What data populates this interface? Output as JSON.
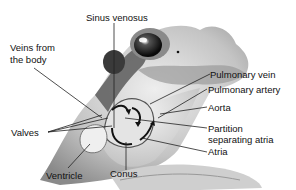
{
  "diagram": {
    "labels": {
      "sinus_venosus": "Sinus venosus",
      "veins_from_body_line1": "Veins from",
      "veins_from_body_line2": "the body",
      "pulmonary_vein": "Pulmonary vein",
      "pulmonary_artery": "Pulmonary artery",
      "aorta": "Aorta",
      "partition_line1": "Partition",
      "partition_line2": "separating atria",
      "atria": "Atria",
      "valves": "Valves",
      "ventricle": "Ventricle",
      "conus": "Conus"
    },
    "colors": {
      "line": "#222222",
      "skin_dark": "#5a5a5a",
      "skin_light": "#d8d8d8"
    }
  }
}
